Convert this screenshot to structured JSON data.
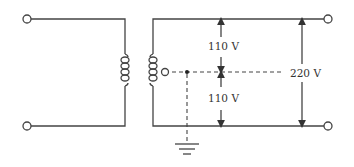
{
  "diagram": {
    "type": "center-tapped transformer (split-phase supply)",
    "labels": {
      "upper_half_voltage": "110 V",
      "lower_half_voltage": "110 V",
      "total_voltage": "220 V"
    },
    "elements": [
      "primary-input-terminals",
      "primary-winding",
      "secondary-winding",
      "center-tap-terminal",
      "neutral-ground-connection",
      "secondary-output-terminals"
    ],
    "colors": {
      "line": "#444444",
      "background": "#ffffff"
    }
  }
}
